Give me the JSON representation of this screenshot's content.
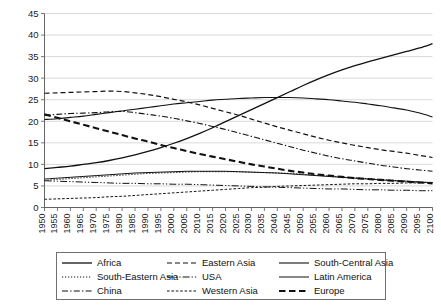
{
  "chart_data": {
    "type": "line",
    "title": "",
    "subtitle": "",
    "xlabel": "",
    "ylabel": "",
    "xlim": [
      1950,
      2100
    ],
    "ylim": [
      0,
      45
    ],
    "y_tick_step": 5,
    "x_tick_step": 5,
    "grid": "horizontal",
    "legend_position": "bottom",
    "legend_columns": 3,
    "x": [
      1950,
      1955,
      1960,
      1965,
      1970,
      1975,
      1980,
      1985,
      1990,
      1995,
      2000,
      2005,
      2010,
      2015,
      2020,
      2025,
      2030,
      2035,
      2040,
      2045,
      2050,
      2055,
      2060,
      2065,
      2070,
      2075,
      2080,
      2085,
      2090,
      2095,
      2100
    ],
    "y_tick_labels": [
      "0",
      "5",
      "10",
      "15",
      "20",
      "25",
      "30",
      "35",
      "40",
      "45"
    ],
    "x_tick_labels": [
      "1950",
      "1955",
      "1960",
      "1965",
      "1970",
      "1975",
      "1980",
      "1985",
      "1990",
      "1995",
      "2000",
      "2005",
      "2010",
      "2015",
      "2020",
      "2025",
      "2030",
      "2035",
      "2040",
      "2045",
      "2050",
      "2055",
      "2060",
      "2065",
      "2070",
      "2075",
      "2080",
      "2085",
      "2090",
      "2095",
      "2100"
    ],
    "series": [
      {
        "name": "Africa",
        "style": "solid",
        "width": 1.3,
        "color": "#111111",
        "values": [
          9.0,
          9.3,
          9.6,
          10.0,
          10.4,
          10.9,
          11.5,
          12.2,
          13.0,
          13.9,
          14.9,
          16.0,
          17.2,
          18.5,
          19.9,
          21.3,
          22.7,
          24.1,
          25.5,
          26.9,
          28.3,
          29.6,
          30.8,
          31.9,
          32.9,
          33.8,
          34.6,
          35.4,
          36.2,
          37.0,
          38.0
        ]
      },
      {
        "name": "South-Eastern Asia",
        "style": "dotted",
        "width": 1.0,
        "color": "#111111",
        "values": [
          6.3,
          6.5,
          6.7,
          6.9,
          7.1,
          7.3,
          7.5,
          7.7,
          7.9,
          8.0,
          8.1,
          8.2,
          8.3,
          8.3,
          8.3,
          8.3,
          8.2,
          8.1,
          8.0,
          7.9,
          7.7,
          7.5,
          7.3,
          7.1,
          6.9,
          6.7,
          6.5,
          6.3,
          6.1,
          5.9,
          5.7
        ]
      },
      {
        "name": "China",
        "style": "dashdot",
        "width": 1.1,
        "color": "#111111",
        "values": [
          21.4,
          21.6,
          21.8,
          21.9,
          22.0,
          22.2,
          22.3,
          22.0,
          21.6,
          21.2,
          20.7,
          20.1,
          19.5,
          18.8,
          18.1,
          17.3,
          16.5,
          15.7,
          14.9,
          14.1,
          13.3,
          12.6,
          11.9,
          11.3,
          10.8,
          10.3,
          9.8,
          9.4,
          9.0,
          8.7,
          8.4
        ]
      },
      {
        "name": "Eastern Asia",
        "style": "dashed",
        "width": 1.2,
        "color": "#111111",
        "values": [
          26.5,
          26.6,
          26.7,
          26.8,
          26.9,
          27.0,
          26.9,
          26.6,
          26.2,
          25.7,
          25.1,
          24.5,
          23.8,
          23.0,
          22.2,
          21.4,
          20.5,
          19.6,
          18.7,
          17.9,
          17.1,
          16.3,
          15.6,
          15.0,
          14.4,
          13.9,
          13.4,
          13.0,
          12.6,
          12.1,
          11.6
        ]
      },
      {
        "name": "USA",
        "style": "dashdotdot",
        "width": 1.0,
        "color": "#111111",
        "values": [
          6.2,
          6.1,
          6.0,
          5.9,
          5.8,
          5.7,
          5.6,
          5.6,
          5.5,
          5.5,
          5.4,
          5.4,
          5.3,
          5.2,
          5.1,
          5.0,
          4.9,
          4.8,
          4.7,
          4.6,
          4.5,
          4.4,
          4.3,
          4.3,
          4.2,
          4.1,
          4.1,
          4.0,
          4.0,
          3.9,
          3.9
        ]
      },
      {
        "name": "Western Asia",
        "style": "finedash",
        "width": 1.0,
        "color": "#111111",
        "values": [
          1.9,
          2.0,
          2.1,
          2.2,
          2.3,
          2.5,
          2.6,
          2.8,
          3.0,
          3.2,
          3.4,
          3.6,
          3.8,
          4.0,
          4.2,
          4.4,
          4.6,
          4.7,
          4.9,
          5.0,
          5.1,
          5.2,
          5.3,
          5.4,
          5.5,
          5.5,
          5.6,
          5.6,
          5.7,
          5.7,
          5.8
        ]
      },
      {
        "name": "South-Central Asia",
        "style": "solid",
        "width": 1.1,
        "color": "#111111",
        "values": [
          20.4,
          20.6,
          20.9,
          21.2,
          21.6,
          22.0,
          22.4,
          22.8,
          23.2,
          23.6,
          24.0,
          24.3,
          24.6,
          24.9,
          25.1,
          25.3,
          25.4,
          25.5,
          25.5,
          25.5,
          25.4,
          25.2,
          25.0,
          24.7,
          24.4,
          24.0,
          23.6,
          23.1,
          22.6,
          21.9,
          21.0
        ]
      },
      {
        "name": "Latin America",
        "style": "solid",
        "width": 1.0,
        "color": "#111111",
        "values": [
          6.6,
          6.8,
          7.0,
          7.2,
          7.4,
          7.6,
          7.8,
          8.0,
          8.1,
          8.2,
          8.3,
          8.4,
          8.4,
          8.4,
          8.4,
          8.3,
          8.2,
          8.1,
          8.0,
          7.8,
          7.6,
          7.4,
          7.2,
          7.0,
          6.8,
          6.6,
          6.4,
          6.2,
          6.1,
          5.9,
          5.8
        ]
      },
      {
        "name": "Europe",
        "style": "thickdash",
        "width": 2.1,
        "color": "#111111",
        "values": [
          21.6,
          20.8,
          20.0,
          19.2,
          18.4,
          17.6,
          16.8,
          16.0,
          15.3,
          14.5,
          13.8,
          13.1,
          12.4,
          11.8,
          11.2,
          10.6,
          10.0,
          9.5,
          9.0,
          8.5,
          8.1,
          7.7,
          7.4,
          7.1,
          6.8,
          6.6,
          6.4,
          6.2,
          6.0,
          5.8,
          5.6
        ]
      }
    ]
  },
  "legend": {
    "entries": [
      {
        "label": "Africa",
        "style": "solid"
      },
      {
        "label": "Eastern Asia",
        "style": "dashed"
      },
      {
        "label": "South-Central Asia",
        "style": "solid"
      },
      {
        "label": "South-Eastern Asia",
        "style": "dotted"
      },
      {
        "label": "USA",
        "style": "dashdotdot"
      },
      {
        "label": "Latin America",
        "style": "solid"
      },
      {
        "label": "China",
        "style": "dashdot"
      },
      {
        "label": "Western Asia",
        "style": "finedash"
      },
      {
        "label": "Europe",
        "style": "thickdash"
      }
    ]
  },
  "colors": {
    "line": "#111111",
    "grid": "#c9c9c9",
    "axis": "#555555",
    "background": "#ffffff",
    "text": "#1a1a1a"
  }
}
